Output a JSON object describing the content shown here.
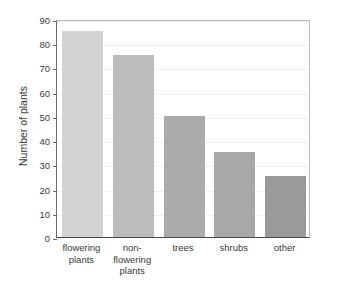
{
  "chart_data": {
    "type": "bar",
    "title": "",
    "xlabel": "",
    "ylabel": "Number of plants",
    "categories": [
      "flowering plants",
      "non-flowering plants",
      "trees",
      "shrubs",
      "other"
    ],
    "category_lines": [
      [
        "flowering",
        "plants"
      ],
      [
        "non-",
        "flowering",
        "plants"
      ],
      [
        "trees"
      ],
      [
        "shrubs"
      ],
      [
        "other"
      ]
    ],
    "values": [
      85,
      75,
      50,
      35,
      25
    ],
    "ylim": [
      0,
      90
    ],
    "ytick_step": 10,
    "yticks": [
      "90",
      "80",
      "70",
      "60",
      "50",
      "40",
      "30",
      "20",
      "10",
      "0"
    ],
    "ytick_values": [
      90,
      80,
      70,
      60,
      50,
      40,
      30,
      20,
      10,
      0
    ],
    "grid": true,
    "legend": false,
    "bar_colors": [
      "#d2d2d2",
      "#bcbcbc",
      "#ababab",
      "#a8a8a8",
      "#9a9a9a"
    ],
    "axis_color": "#4a4a4a",
    "gridline_color": "#f0f0f0",
    "text_color": "#3a3a3a",
    "background": "#ffffff"
  }
}
